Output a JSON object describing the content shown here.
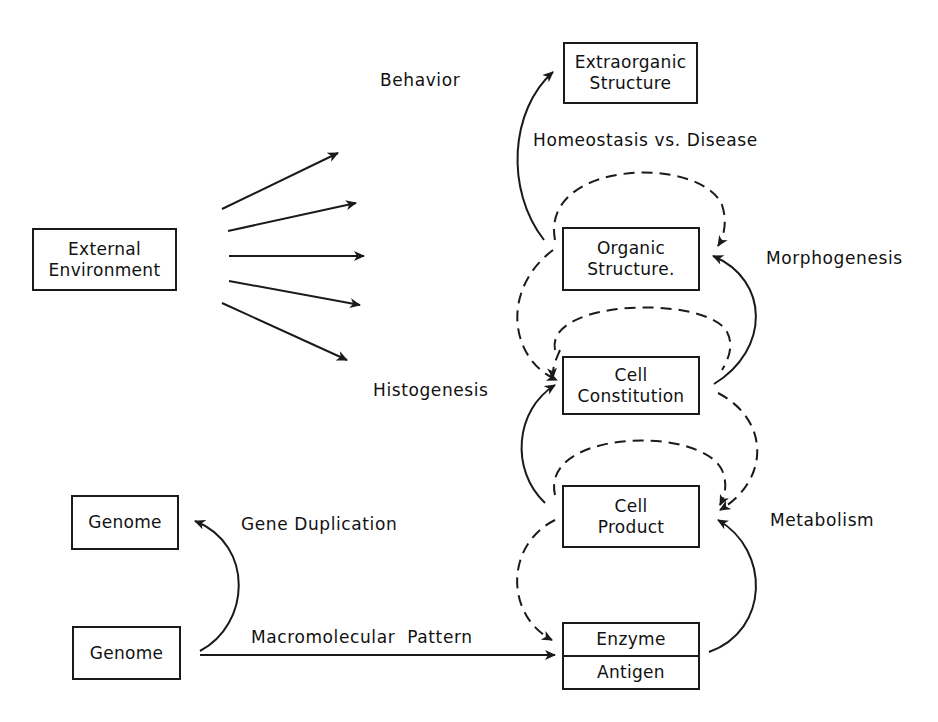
{
  "diagram": {
    "nodes": {
      "extraorganic": {
        "line1": "Extraorganic",
        "line2": "Structure"
      },
      "organic": {
        "line1": "Organic",
        "line2": "Structure."
      },
      "cell_constitution": {
        "line1": "Cell",
        "line2": "Constitution"
      },
      "cell_product": {
        "line1": "Cell",
        "line2": "Product"
      },
      "enzyme_antigen": {
        "top": "Enzyme",
        "bottom": "Antigen"
      },
      "external_env": {
        "line1": "External",
        "line2": "Environment"
      },
      "genome_top": {
        "label": "Genome"
      },
      "genome_bottom": {
        "label": "Genome"
      }
    },
    "labels": {
      "behavior": "Behavior",
      "homeostasis": "Homeostasis vs. Disease",
      "morphogenesis": "Morphogenesis",
      "histogenesis": "Histogenesis",
      "metabolism": "Metabolism",
      "gene_duplication": "Gene Duplication",
      "macromolecular": "Macromolecular  Pattern"
    },
    "colors": {
      "ink": "#1a1a1a",
      "background": "#ffffff"
    }
  }
}
